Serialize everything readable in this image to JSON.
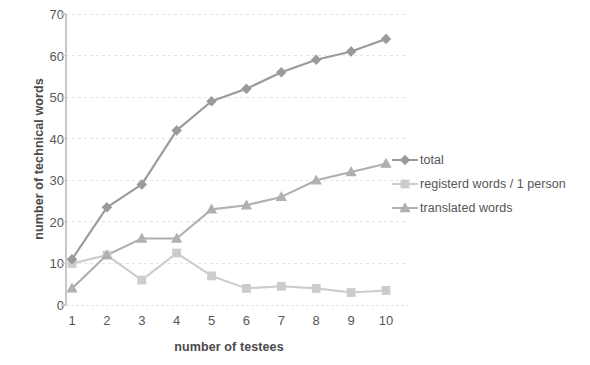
{
  "chart_data": {
    "type": "line",
    "title": "",
    "xlabel": "number of testees",
    "ylabel": "number of technical words",
    "categories": [
      "1",
      "2",
      "3",
      "4",
      "5",
      "6",
      "7",
      "8",
      "9",
      "10"
    ],
    "x": [
      1,
      2,
      3,
      4,
      5,
      6,
      7,
      8,
      9,
      10
    ],
    "ylim": [
      0,
      70
    ],
    "yticks": [
      "0",
      "10",
      "20",
      "30",
      "40",
      "50",
      "60",
      "70"
    ],
    "ytick_values": [
      0,
      10,
      20,
      30,
      40,
      50,
      60,
      70
    ],
    "grid": true,
    "legend_position": "right",
    "series": [
      {
        "name": "total",
        "marker": "diamond",
        "color": "#9a9a9a",
        "values": [
          11,
          23.5,
          29,
          42,
          49,
          52,
          56,
          59,
          61,
          64
        ]
      },
      {
        "name": "registerd words / 1 person",
        "marker": "square",
        "color": "#cccccc",
        "values": [
          10,
          12,
          6,
          12.5,
          7,
          4,
          4.5,
          4,
          3,
          3.5
        ]
      },
      {
        "name": "translated words",
        "marker": "triangle",
        "color": "#b0b0b0",
        "values": [
          4,
          12,
          16,
          16,
          23,
          24,
          26,
          30,
          32,
          34
        ]
      }
    ]
  },
  "colors": {
    "background": "#ffffff",
    "grid": "#e4e4e4",
    "axis": "#c8c8c8",
    "tick_text": "#585858",
    "axis_title": "#4a4a4a",
    "legend_text": "#555555"
  }
}
